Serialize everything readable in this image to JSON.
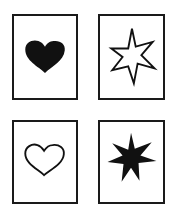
{
  "cards": [
    {
      "id": "top-left",
      "symbol": "heart",
      "style": "filled"
    },
    {
      "id": "top-right",
      "symbol": "seven-point-star",
      "style": "outline"
    },
    {
      "id": "bottom-left",
      "symbol": "heart",
      "style": "outline"
    },
    {
      "id": "bottom-right",
      "symbol": "seven-point-star",
      "style": "filled"
    }
  ],
  "colors": {
    "ink": "#111111",
    "paper": "#ffffff"
  }
}
